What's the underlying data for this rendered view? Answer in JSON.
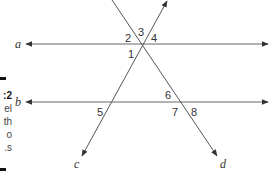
{
  "caption": {
    "fragments": [
      "2:",
      "el",
      "th",
      "o",
      "s."
    ]
  },
  "lines": [
    {
      "name": "a",
      "type": "parallel",
      "label": "a"
    },
    {
      "name": "b",
      "type": "parallel",
      "label": "b"
    },
    {
      "name": "c",
      "type": "transversal",
      "label": "c"
    },
    {
      "name": "d",
      "type": "transversal",
      "label": "d"
    }
  ],
  "angles": [
    "1",
    "2",
    "3",
    "4",
    "5",
    "6",
    "7",
    "8"
  ],
  "colors": {
    "stroke": "#555555",
    "text": "#333333"
  }
}
